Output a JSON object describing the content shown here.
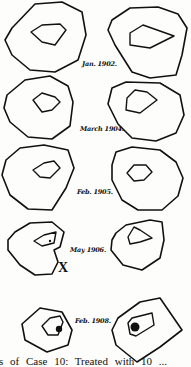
{
  "figure": {
    "rows": [
      {
        "label": "Jan. 1902."
      },
      {
        "label": "March 1904."
      },
      {
        "label": "Feb. 1905."
      },
      {
        "label": "May 1906."
      },
      {
        "label": "Feb. 1908."
      }
    ],
    "marker": "X",
    "caption": "ls of Case 10: Treated with 10 ..."
  }
}
